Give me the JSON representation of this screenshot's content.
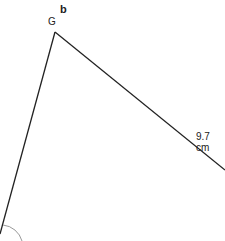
{
  "part_label": "b",
  "vertex_label": "G",
  "side_label": "9.7 cm",
  "colors": {
    "line": "#222222",
    "arc": "#999999"
  }
}
